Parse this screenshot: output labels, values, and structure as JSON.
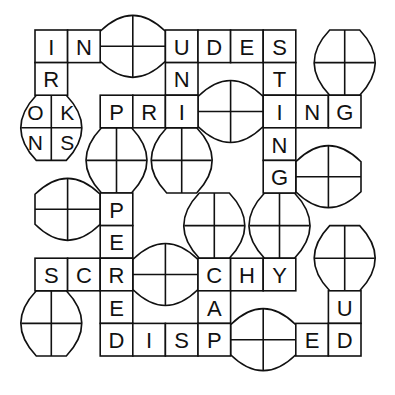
{
  "puzzle": {
    "type": "crossword-fill-in with oval tile slots",
    "grid": {
      "origin_x": 35,
      "origin_y": 30,
      "cell": 32.6
    },
    "colors": {
      "line": "#111111",
      "background": "#ffffff"
    },
    "cells": [
      {
        "c": 0,
        "r": 0,
        "letter": "I"
      },
      {
        "c": 1,
        "r": 0,
        "letter": "N"
      },
      {
        "c": 4,
        "r": 0,
        "letter": "U"
      },
      {
        "c": 5,
        "r": 0,
        "letter": "D"
      },
      {
        "c": 6,
        "r": 0,
        "letter": "E"
      },
      {
        "c": 7,
        "r": 0,
        "letter": "S"
      },
      {
        "c": 0,
        "r": 1,
        "letter": "R"
      },
      {
        "c": 4,
        "r": 1,
        "letter": "N"
      },
      {
        "c": 7,
        "r": 1,
        "letter": "T"
      },
      {
        "c": 2,
        "r": 2,
        "letter": "P"
      },
      {
        "c": 3,
        "r": 2,
        "letter": "R"
      },
      {
        "c": 4,
        "r": 2,
        "letter": "I"
      },
      {
        "c": 7,
        "r": 2,
        "letter": "I"
      },
      {
        "c": 8,
        "r": 2,
        "letter": "N"
      },
      {
        "c": 9,
        "r": 2,
        "letter": "G"
      },
      {
        "c": 7,
        "r": 3,
        "letter": "N"
      },
      {
        "c": 7,
        "r": 4,
        "letter": "G"
      },
      {
        "c": 2,
        "r": 5,
        "letter": "P"
      },
      {
        "c": 2,
        "r": 6,
        "letter": "E"
      },
      {
        "c": 0,
        "r": 7,
        "letter": "S"
      },
      {
        "c": 1,
        "r": 7,
        "letter": "C"
      },
      {
        "c": 2,
        "r": 7,
        "letter": "R"
      },
      {
        "c": 5,
        "r": 7,
        "letter": "C"
      },
      {
        "c": 6,
        "r": 7,
        "letter": "H"
      },
      {
        "c": 7,
        "r": 7,
        "letter": "Y"
      },
      {
        "c": 2,
        "r": 8,
        "letter": "E"
      },
      {
        "c": 5,
        "r": 8,
        "letter": "A"
      },
      {
        "c": 9,
        "r": 8,
        "letter": "U"
      },
      {
        "c": 2,
        "r": 9,
        "letter": "D"
      },
      {
        "c": 3,
        "r": 9,
        "letter": "I"
      },
      {
        "c": 4,
        "r": 9,
        "letter": "S"
      },
      {
        "c": 5,
        "r": 9,
        "letter": "P"
      },
      {
        "c": 8,
        "r": 9,
        "letter": "E"
      },
      {
        "c": 9,
        "r": 9,
        "letter": "D"
      }
    ],
    "ovals": [
      {
        "id": "oval-row0-between-in-udes",
        "orient": "h",
        "c": 2,
        "r": 0,
        "letters": [
          "",
          "",
          "",
          ""
        ]
      },
      {
        "id": "oval-top-right",
        "orient": "v",
        "c": 9,
        "r": 0,
        "letters": [
          "",
          "",
          "",
          ""
        ]
      },
      {
        "id": "oval-okns",
        "orient": "v",
        "c": 0,
        "r": 2,
        "letters": [
          "O",
          "K",
          "N",
          "S"
        ]
      },
      {
        "id": "oval-row2-between-pri-ing",
        "orient": "h",
        "c": 5,
        "r": 2,
        "letters": [
          "",
          "",
          "",
          ""
        ]
      },
      {
        "id": "oval-below-p",
        "orient": "v",
        "c": 2,
        "r": 3,
        "letters": [
          "",
          "",
          "",
          ""
        ]
      },
      {
        "id": "oval-below-i",
        "orient": "v",
        "c": 4,
        "r": 3,
        "letters": [
          "",
          "",
          "",
          ""
        ]
      },
      {
        "id": "oval-right-of-g",
        "orient": "h",
        "c": 8,
        "r": 4,
        "letters": [
          "",
          "",
          "",
          ""
        ]
      },
      {
        "id": "oval-left-of-pe",
        "orient": "h",
        "c": 0,
        "r": 5,
        "letters": [
          "",
          "",
          "",
          ""
        ]
      },
      {
        "id": "oval-above-c",
        "orient": "v",
        "c": 5,
        "r": 5,
        "letters": [
          "",
          "",
          "",
          ""
        ]
      },
      {
        "id": "oval-above-y",
        "orient": "v",
        "c": 7,
        "r": 5,
        "letters": [
          "",
          "",
          "",
          ""
        ]
      },
      {
        "id": "oval-above-u",
        "orient": "v",
        "c": 9,
        "r": 6,
        "letters": [
          "",
          "",
          "",
          ""
        ]
      },
      {
        "id": "oval-row7-between-scr-chy",
        "orient": "h",
        "c": 3,
        "r": 7,
        "letters": [
          "",
          "",
          "",
          ""
        ]
      },
      {
        "id": "oval-below-sc",
        "orient": "v",
        "c": 0,
        "r": 8,
        "letters": [
          "",
          "",
          "",
          ""
        ]
      },
      {
        "id": "oval-row9-between-disp-ed",
        "orient": "h",
        "c": 6,
        "r": 9,
        "letters": [
          "",
          "",
          "",
          ""
        ]
      }
    ],
    "words_visible": {
      "row0": [
        "IN",
        "UDES"
      ],
      "row2": [
        "PRI",
        "ING"
      ],
      "row7": [
        "SCR",
        "CHY"
      ],
      "row9": [
        "DISP",
        "ED"
      ],
      "col0": [
        "IR"
      ],
      "col4": [
        "UNI"
      ],
      "col7": [
        "STINGNG"
      ],
      "col2": [
        "PEREED"
      ],
      "col5": [
        "CAP"
      ],
      "col9": [
        "UD"
      ]
    }
  }
}
